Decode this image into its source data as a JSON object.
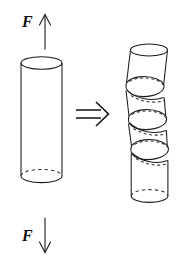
{
  "figure": {
    "background_color": "#ffffff",
    "line_color": "#1a1a1a",
    "dashed_line_color": "#333333"
  },
  "labels": {
    "force_top": "F",
    "force_bottom": "F"
  },
  "arrows": {
    "top": {
      "name": "up-arrow",
      "direction": "up"
    },
    "bottom": {
      "name": "down-arrow",
      "direction": "down"
    },
    "implies": {
      "name": "double-right-arrow",
      "direction": "right",
      "glyph": "⟹"
    }
  },
  "shapes": {
    "left_cylinder": {
      "name": "straight-cylinder",
      "top_ellipse": "solid",
      "bottom_front_arc": "solid",
      "bottom_back_arc": "dashed"
    },
    "right_cylinder": {
      "name": "twisted-cylinder",
      "top_ellipse": "solid",
      "bottom_front_arc": "solid",
      "bottom_back_arc": "dashed",
      "helical_folds": 3,
      "tilt": "leaning-right"
    }
  }
}
